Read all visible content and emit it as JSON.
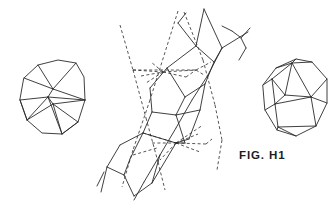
{
  "figure": {
    "label": "FIG. H1",
    "label_position": {
      "x": 239,
      "y": 149
    },
    "background_color": "#ffffff",
    "ink_color": "#2a2a2a",
    "canvas": {
      "width": 336,
      "height": 218
    }
  },
  "diagram_data": {
    "type": "line-drawing",
    "title": "FIG. H1",
    "description": "Crystallographic line drawing: two faceted polyhedra flanking a central perspective construction with dashed projection guides",
    "stroke_color": "#2a2a2a",
    "stroke_width": 0.9,
    "dash_pattern": "3,2.4",
    "parts": [
      {
        "name": "left-polyhedron",
        "kind": "polyhedron",
        "outline": [
          [
            24,
            78
          ],
          [
            38,
            65
          ],
          [
            58,
            60
          ],
          [
            76,
            63
          ],
          [
            84,
            77
          ],
          [
            85,
            100
          ],
          [
            78,
            122
          ],
          [
            62,
            134
          ],
          [
            42,
            133
          ],
          [
            27,
            120
          ],
          [
            20,
            100
          ]
        ],
        "internal_edges": [
          [
            [
              38,
              65
            ],
            [
              53,
              89
            ]
          ],
          [
            [
              53,
              89
            ],
            [
              76,
              63
            ]
          ],
          [
            [
              53,
              89
            ],
            [
              24,
              78
            ]
          ],
          [
            [
              20,
              100
            ],
            [
              48,
              97
            ]
          ],
          [
            [
              48,
              97
            ],
            [
              53,
              89
            ]
          ],
          [
            [
              48,
              97
            ],
            [
              85,
              100
            ]
          ],
          [
            [
              53,
              89
            ],
            [
              85,
              100
            ]
          ],
          [
            [
              48,
              97
            ],
            [
              62,
              134
            ]
          ],
          [
            [
              53,
              104
            ],
            [
              62,
              134
            ]
          ],
          [
            [
              20,
              100
            ],
            [
              27,
              120
            ]
          ],
          [
            [
              48,
              97
            ],
            [
              27,
              120
            ]
          ],
          [
            [
              53,
              104
            ],
            [
              85,
              100
            ]
          ],
          [
            [
              48,
              97
            ],
            [
              53,
              104
            ]
          ],
          [
            [
              62,
              134
            ],
            [
              78,
              122
            ]
          ],
          [
            [
              53,
              104
            ],
            [
              78,
              122
            ]
          ],
          [
            [
              53,
              104
            ],
            [
              27,
              120
            ]
          ]
        ]
      },
      {
        "name": "right-polyhedron",
        "kind": "polyhedron",
        "outline": [
          [
            263,
            85
          ],
          [
            276,
            68
          ],
          [
            296,
            59
          ],
          [
            312,
            62
          ],
          [
            327,
            79
          ],
          [
            327,
            103
          ],
          [
            316,
            126
          ],
          [
            296,
            136
          ],
          [
            277,
            130
          ],
          [
            265,
            110
          ]
        ],
        "internal_edges": [
          [
            [
              276,
              68
            ],
            [
              292,
              63
            ]
          ],
          [
            [
              292,
              63
            ],
            [
              296,
              59
            ]
          ],
          [
            [
              292,
              63
            ],
            [
              272,
              79
            ]
          ],
          [
            [
              272,
              79
            ],
            [
              263,
              85
            ]
          ],
          [
            [
              272,
              79
            ],
            [
              275,
              104
            ]
          ],
          [
            [
              275,
              104
            ],
            [
              265,
              110
            ]
          ],
          [
            [
              292,
              63
            ],
            [
              285,
              95
            ]
          ],
          [
            [
              285,
              95
            ],
            [
              272,
              79
            ]
          ],
          [
            [
              285,
              95
            ],
            [
              275,
              104
            ]
          ],
          [
            [
              292,
              63
            ],
            [
              311,
              97
            ]
          ],
          [
            [
              311,
              97
            ],
            [
              327,
              79
            ]
          ],
          [
            [
              285,
              95
            ],
            [
              311,
              97
            ]
          ],
          [
            [
              275,
              104
            ],
            [
              311,
              97
            ]
          ],
          [
            [
              275,
              104
            ],
            [
              278,
              127
            ]
          ],
          [
            [
              278,
              127
            ],
            [
              277,
              130
            ]
          ],
          [
            [
              311,
              97
            ],
            [
              316,
              126
            ]
          ],
          [
            [
              278,
              127
            ],
            [
              316,
              126
            ]
          ],
          [
            [
              278,
              127
            ],
            [
              296,
              136
            ]
          ],
          [
            [
              292,
              63
            ],
            [
              312,
              62
            ]
          ],
          [
            [
              311,
              97
            ],
            [
              327,
              103
            ]
          ]
        ]
      },
      {
        "name": "central-construction",
        "kind": "perspective-projection",
        "vanishing_points": [
          [
            163,
            72
          ],
          [
            176,
            143
          ]
        ],
        "solid_edges": [
          [
            [
              204,
              9
            ],
            [
              196,
              46
            ]
          ],
          [
            [
              196,
              46
            ],
            [
              167,
              68
            ]
          ],
          [
            [
              167,
              68
            ],
            [
              150,
              88
            ]
          ],
          [
            [
              150,
              88
            ],
            [
              152,
              112
            ]
          ],
          [
            [
              152,
              112
            ],
            [
              143,
              133
            ]
          ],
          [
            [
              143,
              133
            ],
            [
              120,
              145
            ]
          ],
          [
            [
              120,
              145
            ],
            [
              107,
              167
            ]
          ],
          [
            [
              107,
              167
            ],
            [
              101,
              192
            ]
          ],
          [
            [
              204,
              9
            ],
            [
              222,
              48
            ]
          ],
          [
            [
              222,
              48
            ],
            [
              214,
              62
            ]
          ],
          [
            [
              214,
              62
            ],
            [
              196,
              46
            ]
          ],
          [
            [
              214,
              62
            ],
            [
              205,
              84
            ]
          ],
          [
            [
              205,
              84
            ],
            [
              185,
              97
            ]
          ],
          [
            [
              185,
              97
            ],
            [
              167,
              68
            ]
          ],
          [
            [
              185,
              97
            ],
            [
              176,
              115
            ]
          ],
          [
            [
              176,
              115
            ],
            [
              152,
              112
            ]
          ],
          [
            [
              176,
              115
            ],
            [
              185,
              143
            ]
          ],
          [
            [
              185,
              143
            ],
            [
              176,
              143
            ]
          ],
          [
            [
              176,
              143
            ],
            [
              143,
              133
            ]
          ],
          [
            [
              205,
              84
            ],
            [
              200,
              110
            ]
          ],
          [
            [
              200,
              110
            ],
            [
              176,
              115
            ]
          ],
          [
            [
              200,
              110
            ],
            [
              189,
              139
            ]
          ],
          [
            [
              222,
              48
            ],
            [
              240,
              37
            ]
          ],
          [
            [
              240,
              37
            ],
            [
              232,
              31
            ]
          ],
          [
            [
              232,
              31
            ],
            [
              222,
              26
            ]
          ],
          [
            [
              240,
              37
            ],
            [
              248,
              32
            ]
          ],
          [
            [
              222,
              48
            ],
            [
              208,
              75
            ]
          ],
          [
            [
              208,
              75
            ],
            [
              192,
              100
            ]
          ],
          [
            [
              192,
              100
            ],
            [
              176,
              128
            ]
          ],
          [
            [
              176,
              128
            ],
            [
              160,
              155
            ]
          ],
          [
            [
              160,
              155
            ],
            [
              144,
              182
            ]
          ],
          [
            [
              144,
              182
            ],
            [
              134,
              200
            ]
          ],
          [
            [
              250,
              28
            ],
            [
              241,
              38
            ]
          ],
          [
            [
              241,
              38
            ],
            [
              246,
              48
            ]
          ],
          [
            [
              246,
              48
            ],
            [
              239,
              60
            ]
          ],
          [
            [
              104,
              172
            ],
            [
              97,
              186
            ]
          ],
          [
            [
              143,
              133
            ],
            [
              130,
              159
            ]
          ],
          [
            [
              130,
              159
            ],
            [
              124,
              175
            ]
          ],
          [
            [
              124,
              175
            ],
            [
              134,
              196
            ]
          ],
          [
            [
              134,
              196
            ],
            [
              152,
              183
            ]
          ],
          [
            [
              152,
              183
            ],
            [
              160,
              155
            ]
          ],
          [
            [
              124,
              175
            ],
            [
              107,
              167
            ]
          ],
          [
            [
              152,
              183
            ],
            [
              176,
              143
            ]
          ],
          [
            [
              189,
              139
            ],
            [
              176,
              143
            ]
          ],
          [
            [
              196,
              46
            ],
            [
              178,
              23
            ]
          ],
          [
            [
              178,
              23
            ],
            [
              186,
              13
            ]
          ]
        ],
        "dashed_edges": [
          [
            [
              178,
              11
            ],
            [
              150,
              100
            ]
          ],
          [
            [
              150,
              100
            ],
            [
              133,
              150
            ]
          ],
          [
            [
              133,
              150
            ],
            [
              122,
              187
            ]
          ],
          [
            [
              120,
              25
            ],
            [
              133,
              70
            ]
          ],
          [
            [
              133,
              70
            ],
            [
              146,
              118
            ]
          ],
          [
            [
              146,
              118
            ],
            [
              158,
              162
            ]
          ],
          [
            [
              158,
              162
            ],
            [
              165,
              190
            ]
          ],
          [
            [
              133,
              70
            ],
            [
              196,
              70
            ]
          ],
          [
            [
              133,
              70
            ],
            [
              163,
              72
            ]
          ],
          [
            [
              163,
              72
            ],
            [
              196,
              70
            ]
          ],
          [
            [
              196,
              70
            ],
            [
              204,
              75
            ]
          ],
          [
            [
              141,
              76
            ],
            [
              163,
              72
            ]
          ],
          [
            [
              163,
              72
            ],
            [
              186,
              77
            ]
          ],
          [
            [
              186,
              77
            ],
            [
              196,
              70
            ]
          ],
          [
            [
              152,
              143
            ],
            [
              176,
              143
            ]
          ],
          [
            [
              176,
              143
            ],
            [
              206,
              144
            ]
          ],
          [
            [
              206,
              144
            ],
            [
              212,
              139
            ]
          ],
          [
            [
              176,
              143
            ],
            [
              198,
              134
            ]
          ],
          [
            [
              176,
              143
            ],
            [
              203,
              125
            ]
          ],
          [
            [
              176,
              143
            ],
            [
              200,
              152
            ]
          ],
          [
            [
              163,
              72
            ],
            [
              151,
              62
            ]
          ],
          [
            [
              163,
              72
            ],
            [
              146,
              83
            ]
          ],
          [
            [
              196,
              70
            ],
            [
              211,
              62
            ]
          ],
          [
            [
              184,
              12
            ],
            [
              203,
              60
            ]
          ],
          [
            [
              203,
              60
            ],
            [
              215,
              105
            ]
          ],
          [
            [
              215,
              105
            ],
            [
              222,
              140
            ]
          ],
          [
            [
              222,
              140
            ],
            [
              217,
              170
            ]
          ],
          [
            [
              143,
              133
            ],
            [
              176,
              143
            ]
          ],
          [
            [
              133,
              155
            ],
            [
              157,
              148
            ]
          ],
          [
            [
              176,
              143
            ],
            [
              160,
              160
            ]
          ]
        ]
      }
    ]
  }
}
